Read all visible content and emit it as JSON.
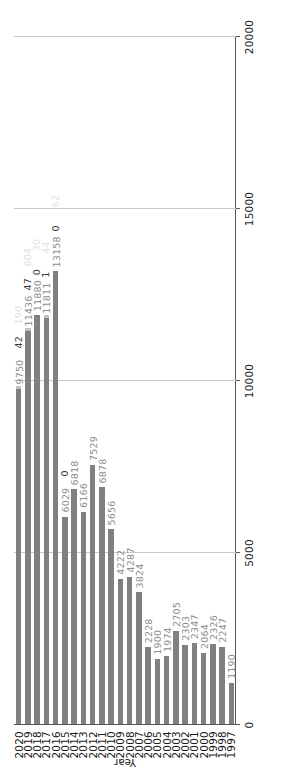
{
  "chart_data": {
    "type": "bar",
    "orientation": "vertical-rendered-rotated",
    "title": "",
    "subtitle": "",
    "xlabel": "Year",
    "ylabel": "",
    "ylim": [
      0,
      20000
    ],
    "grid": true,
    "legend": "none",
    "value_ticks": [
      "0",
      "5000",
      "10000",
      "15000",
      "20000"
    ],
    "value_tick_values": [
      0,
      5000,
      10000,
      15000,
      20000
    ],
    "categories": [
      "1997",
      "1998",
      "1999",
      "2000",
      "2001",
      "2002",
      "2003",
      "2004",
      "2005",
      "2006",
      "2007",
      "2008",
      "2009",
      "2010",
      "2011",
      "2012",
      "2013",
      "2014",
      "2015",
      "2016",
      "2017",
      "2018",
      "2019",
      "2020"
    ],
    "series": [
      {
        "name": "primary",
        "color": "#808080",
        "values": [
          1190,
          2247,
          2326,
          2064,
          2347,
          2303,
          2705,
          1974,
          1900,
          2228,
          3824,
          4287,
          4222,
          5656,
          6878,
          7529,
          6166,
          6818,
          6029,
          13158,
          11811,
          11880,
          11436,
          9750
        ],
        "labels": [
          "1190",
          "2247",
          "2326",
          "2064",
          "2347",
          "2303",
          "2705",
          "1974",
          "1900",
          "2228",
          "3824",
          "4287",
          "4222",
          "5656",
          "6878",
          "7529",
          "6166",
          "6818",
          "6029",
          "13158",
          "11811",
          "11880",
          "11436",
          "9750"
        ]
      },
      {
        "name": "secondary",
        "color": "#c4c4c4",
        "values": [
          null,
          null,
          null,
          null,
          null,
          null,
          null,
          null,
          null,
          null,
          null,
          null,
          null,
          null,
          null,
          null,
          null,
          null,
          0,
          0,
          1,
          0,
          47,
          42
        ],
        "labels": [
          "",
          "",
          "",
          "",
          "",
          "",
          "",
          "",
          "",
          "",
          "",
          "",
          "",
          "",
          "",
          "",
          "",
          "",
          "0",
          "0",
          "1",
          "0",
          "47",
          "42"
        ]
      },
      {
        "name": "tertiary-faint",
        "color": "#e2e2e2",
        "values": [
          null,
          null,
          null,
          null,
          null,
          null,
          null,
          null,
          null,
          null,
          null,
          null,
          null,
          null,
          null,
          null,
          null,
          null,
          null,
          62,
          44,
          30,
          604,
          190
        ],
        "labels": [
          "",
          "",
          "",
          "",
          "",
          "",
          "",
          "",
          "",
          "",
          "",
          "",
          "",
          "",
          "",
          "",
          "",
          "",
          "",
          "62",
          "44",
          "30",
          "604",
          "190"
        ]
      }
    ]
  },
  "axis": {
    "category_title": "Year"
  }
}
